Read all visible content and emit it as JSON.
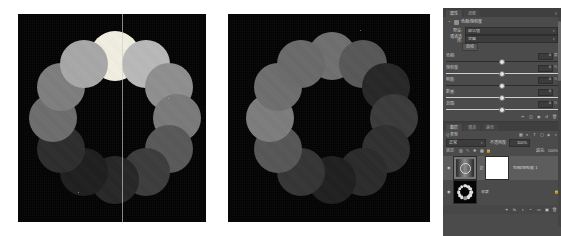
{
  "canvas_left": {
    "name": "left-image-canvas",
    "background": "#030303",
    "guide_label": "vertical guide",
    "dots": [
      {
        "angle": -90,
        "gray": "#f2f0e2",
        "r": 25
      },
      {
        "angle": -60,
        "gray": "#b9b9b9",
        "r": 24
      },
      {
        "angle": -30,
        "gray": "#8f8f8f",
        "r": 24
      },
      {
        "angle": 0,
        "gray": "#7a7a7a",
        "r": 24
      },
      {
        "angle": 30,
        "gray": "#585858",
        "r": 24
      },
      {
        "angle": 60,
        "gray": "#3c3c3c",
        "r": 24
      },
      {
        "angle": 90,
        "gray": "#262626",
        "r": 24
      },
      {
        "angle": 120,
        "gray": "#1e1e1e",
        "r": 24
      },
      {
        "angle": 150,
        "gray": "#2c2c2c",
        "r": 24
      },
      {
        "angle": 180,
        "gray": "#6d6d6d",
        "r": 24
      },
      {
        "angle": 210,
        "gray": "#7e7e7e",
        "r": 24
      },
      {
        "angle": 240,
        "gray": "#a8a8a8",
        "r": 24
      }
    ]
  },
  "canvas_right": {
    "name": "right-image-canvas",
    "background": "#030303",
    "dots": [
      {
        "angle": -90,
        "gray": "#6f6f6f",
        "r": 24
      },
      {
        "angle": -60,
        "gray": "#575757",
        "r": 24
      },
      {
        "angle": -30,
        "gray": "#262626",
        "r": 24
      },
      {
        "angle": 0,
        "gray": "#3a3a3a",
        "r": 24
      },
      {
        "angle": 30,
        "gray": "#2f2f2f",
        "r": 24
      },
      {
        "angle": 60,
        "gray": "#2a2a2a",
        "r": 24
      },
      {
        "angle": 90,
        "gray": "#1f1f1f",
        "r": 24
      },
      {
        "angle": 120,
        "gray": "#343434",
        "r": 24
      },
      {
        "angle": 150,
        "gray": "#565656",
        "r": 24
      },
      {
        "angle": 180,
        "gray": "#7c7c7c",
        "r": 24
      },
      {
        "angle": 210,
        "gray": "#6e6e6e",
        "r": 24
      },
      {
        "angle": 240,
        "gray": "#6a6a6a",
        "r": 24
      }
    ]
  },
  "panel": {
    "tabs": [
      {
        "label": "属性",
        "active": true
      },
      {
        "label": "调整",
        "active": false
      }
    ],
    "menu_icon": "panel-menu-icon",
    "adjustment": {
      "icon_left": "adjustment-icon",
      "icon_preset": "preset-icon",
      "title": "色相/饱和度",
      "preset_row": {
        "caption": "预设:",
        "value": "默认值"
      },
      "channel_row": {
        "caption": "通道选择:",
        "value": "全图"
      },
      "auto_button": "自动",
      "sliders": [
        {
          "name": "色相:",
          "value": "0",
          "unit": "度",
          "pos": 50,
          "dark_track": true
        },
        {
          "name": "饱和度:",
          "value": "0",
          "unit": "%",
          "pos": 50,
          "dark_track": false
        },
        {
          "name": "明度:",
          "value": "0",
          "unit": "%",
          "pos": 50,
          "dark_track": true
        },
        {
          "name": "数量:",
          "value": "0",
          "unit": "",
          "pos": 50,
          "dark_track": false
        },
        {
          "name": "范围:",
          "value": "0",
          "unit": "%",
          "pos": 50,
          "dark_track": false
        }
      ],
      "footer_icons": [
        "eyedropper-icon",
        "clip-icon",
        "eye-icon",
        "reset-icon",
        "delete-icon"
      ]
    },
    "layers": {
      "tabs": [
        {
          "label": "图层",
          "active": true
        },
        {
          "label": "通道",
          "active": false
        },
        {
          "label": "路径",
          "active": false
        }
      ],
      "filter_row": {
        "caption": "Q 类型",
        "icons": [
          "pixel-icon",
          "adjust-icon",
          "text-icon",
          "shape-icon",
          "smart-icon",
          "toggle-icon"
        ]
      },
      "blend_row": {
        "mode": "正常",
        "opacity_label": "不透明度:",
        "opacity_value": "100%"
      },
      "lock_row": {
        "caption": "锁定:",
        "icons": [
          "lock-transparency-icon",
          "lock-brush-icon",
          "lock-move-icon",
          "lock-nest-icon",
          "lock-all-icon"
        ],
        "fill_label": "填充:",
        "fill_value": "100%"
      },
      "items": [
        {
          "eye": "eye-icon",
          "thumb": "gradient-map-thumbnail",
          "has_mask": true,
          "link": "link-icon",
          "name": "色相/饱和度 1",
          "lock": ""
        },
        {
          "eye": "eye-icon",
          "thumb": "ring-image-thumbnail",
          "has_mask": false,
          "link": "",
          "name": "背景",
          "lock": "lock-icon"
        }
      ],
      "bottom_icons": [
        "link-layers-icon",
        "fx-icon",
        "mask-icon",
        "adjustment-icon",
        "group-icon",
        "new-layer-icon",
        "delete-layer-icon"
      ]
    }
  }
}
